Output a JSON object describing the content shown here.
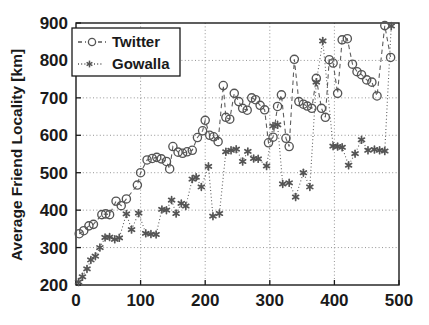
{
  "chart_data": {
    "type": "scatter",
    "title": "",
    "xlabel": "",
    "ylabel": "Average Friend Locality [km]",
    "xlim": [
      0,
      500
    ],
    "ylim": [
      200,
      900
    ],
    "xticks": [
      0,
      100,
      200,
      300,
      400,
      500
    ],
    "yticks": [
      200,
      300,
      400,
      500,
      600,
      700,
      800,
      900
    ],
    "xticklabels": [
      "0",
      "100",
      "200",
      "300",
      "400",
      "500"
    ],
    "yticklabels": [
      "200",
      "300",
      "400",
      "500",
      "600",
      "700",
      "800",
      "900"
    ],
    "grid": true,
    "grid_style": "dotted",
    "legend_position": "upper left",
    "series": [
      {
        "name": "Twitter",
        "marker": "circle-open",
        "line_style": "dashed",
        "color": "#555555",
        "points": [
          [
            5,
            337
          ],
          [
            12,
            345
          ],
          [
            20,
            358
          ],
          [
            27,
            362
          ],
          [
            40,
            388
          ],
          [
            46,
            390
          ],
          [
            52,
            388
          ],
          [
            62,
            424
          ],
          [
            70,
            412
          ],
          [
            78,
            430
          ],
          [
            95,
            467
          ],
          [
            100,
            500
          ],
          [
            110,
            534
          ],
          [
            118,
            538
          ],
          [
            125,
            541
          ],
          [
            132,
            537
          ],
          [
            140,
            530
          ],
          [
            145,
            510
          ],
          [
            150,
            570
          ],
          [
            158,
            555
          ],
          [
            165,
            552
          ],
          [
            172,
            556
          ],
          [
            180,
            560
          ],
          [
            188,
            594
          ],
          [
            196,
            612
          ],
          [
            200,
            640
          ],
          [
            207,
            600
          ],
          [
            213,
            596
          ],
          [
            220,
            583
          ],
          [
            228,
            733
          ],
          [
            232,
            648
          ],
          [
            238,
            643
          ],
          [
            245,
            712
          ],
          [
            252,
            690
          ],
          [
            258,
            672
          ],
          [
            265,
            667
          ],
          [
            272,
            700
          ],
          [
            278,
            695
          ],
          [
            285,
            680
          ],
          [
            292,
            668
          ],
          [
            298,
            580
          ],
          [
            305,
            595
          ],
          [
            312,
            677
          ],
          [
            318,
            708
          ],
          [
            325,
            592
          ],
          [
            330,
            570
          ],
          [
            338,
            803
          ],
          [
            345,
            690
          ],
          [
            352,
            683
          ],
          [
            358,
            678
          ],
          [
            365,
            672
          ],
          [
            372,
            752
          ],
          [
            380,
            672
          ],
          [
            386,
            648
          ],
          [
            392,
            802
          ],
          [
            398,
            793
          ],
          [
            405,
            712
          ],
          [
            412,
            855
          ],
          [
            420,
            858
          ],
          [
            428,
            790
          ],
          [
            435,
            770
          ],
          [
            442,
            762
          ],
          [
            450,
            748
          ],
          [
            458,
            742
          ],
          [
            466,
            705
          ],
          [
            478,
            893
          ],
          [
            487,
            808
          ]
        ]
      },
      {
        "name": "Gowalla",
        "marker": "asterisk",
        "line_style": "dotted",
        "color": "#555555",
        "points": [
          [
            4,
            208
          ],
          [
            10,
            222
          ],
          [
            17,
            243
          ],
          [
            23,
            267
          ],
          [
            30,
            277
          ],
          [
            37,
            300
          ],
          [
            45,
            327
          ],
          [
            52,
            328
          ],
          [
            60,
            322
          ],
          [
            67,
            326
          ],
          [
            78,
            390
          ],
          [
            86,
            348
          ],
          [
            97,
            392
          ],
          [
            108,
            338
          ],
          [
            116,
            336
          ],
          [
            124,
            335
          ],
          [
            133,
            402
          ],
          [
            140,
            400
          ],
          [
            148,
            427
          ],
          [
            155,
            391
          ],
          [
            163,
            418
          ],
          [
            170,
            411
          ],
          [
            180,
            483
          ],
          [
            186,
            488
          ],
          [
            194,
            462
          ],
          [
            205,
            517
          ],
          [
            212,
            384
          ],
          [
            222,
            391
          ],
          [
            232,
            556
          ],
          [
            240,
            560
          ],
          [
            248,
            563
          ],
          [
            258,
            530
          ],
          [
            266,
            557
          ],
          [
            275,
            538
          ],
          [
            282,
            537
          ],
          [
            295,
            518
          ],
          [
            305,
            625
          ],
          [
            312,
            628
          ],
          [
            320,
            470
          ],
          [
            330,
            473
          ],
          [
            340,
            435
          ],
          [
            352,
            500
          ],
          [
            362,
            462
          ],
          [
            372,
            742
          ],
          [
            382,
            852
          ],
          [
            398,
            571
          ],
          [
            405,
            570
          ],
          [
            412,
            568
          ],
          [
            422,
            520
          ],
          [
            432,
            551
          ],
          [
            442,
            588
          ],
          [
            452,
            560
          ],
          [
            462,
            562
          ],
          [
            470,
            560
          ],
          [
            478,
            558
          ],
          [
            488,
            892
          ]
        ]
      }
    ]
  },
  "legend": {
    "entries": [
      {
        "label": "Twitter",
        "marker": "circle-open",
        "line": "dashed"
      },
      {
        "label": "Gowalla",
        "marker": "asterisk",
        "line": "dotted"
      }
    ]
  },
  "axes": {
    "y_title": "Average Friend Locality [km]"
  }
}
